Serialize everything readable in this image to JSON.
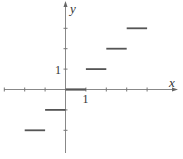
{
  "chart_data": {
    "type": "line",
    "title": "",
    "xlabel": "x",
    "ylabel": "y",
    "xlim": [
      -3.0,
      4.8
    ],
    "ylim": [
      -3.1,
      4.2
    ],
    "grid": false,
    "legend": null,
    "x_ticks": [
      -3,
      -2,
      -1,
      1,
      2,
      3,
      4
    ],
    "y_ticks": [
      -2,
      -1,
      1,
      2,
      3
    ],
    "tick_labels": {
      "x": "1",
      "y": "1"
    },
    "series": [
      {
        "name": "floor(x)",
        "segments": [
          {
            "x_start": -2,
            "x_end": -1,
            "y": -2
          },
          {
            "x_start": -1,
            "x_end": 0,
            "y": -1
          },
          {
            "x_start": 0,
            "x_end": 1,
            "y": 0
          },
          {
            "x_start": 1,
            "x_end": 2,
            "y": 1
          },
          {
            "x_start": 2,
            "x_end": 3,
            "y": 2
          },
          {
            "x_start": 3,
            "x_end": 4,
            "y": 3
          }
        ]
      }
    ]
  },
  "labels": {
    "x_axis": "x",
    "y_axis": "y",
    "x_tick_one": "1",
    "y_tick_one": "1"
  },
  "colors": {
    "axis": "#777777",
    "segment": "#555555"
  }
}
